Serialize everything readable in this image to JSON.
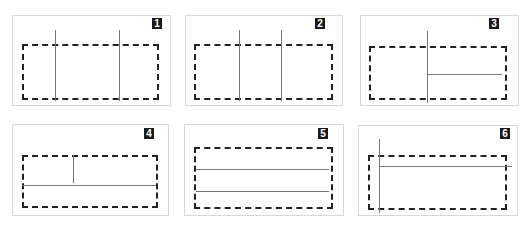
{
  "header_text": "",
  "panels": [
    {
      "label": "1"
    },
    {
      "label": "2"
    },
    {
      "label": "3"
    },
    {
      "label": "4"
    },
    {
      "label": "5"
    },
    {
      "label": "6"
    }
  ],
  "colors": {
    "dash": "#222222",
    "line": "#777777",
    "badge_bg": "#1a1a1a",
    "badge_fg": "#ffffff",
    "panel_border": "#d8d8d8"
  }
}
